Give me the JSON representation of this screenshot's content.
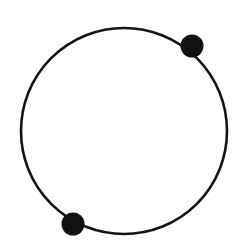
{
  "figure": {
    "type": "geometric-diagram",
    "canvas": {
      "width": 249,
      "height": 248,
      "background_color": "#ffffff"
    },
    "circle": {
      "name": "circle-outline",
      "center_x": 124,
      "center_y": 131,
      "radius": 103,
      "stroke_color": "#141414",
      "stroke_width": 2.6,
      "fill": "none",
      "style": "hand-drawn"
    },
    "points": [
      {
        "id": "point-upper-right",
        "label": "",
        "center_x": 192,
        "center_y": 46,
        "radius": 11.5,
        "fill_color": "#111111",
        "angle_degrees": 34,
        "position_description": "upper-right on circumference"
      },
      {
        "id": "point-lower-left",
        "label": "",
        "center_x": 73,
        "center_y": 224,
        "radius": 11.5,
        "fill_color": "#111111",
        "angle_degrees": 214,
        "position_description": "lower-left on circumference"
      }
    ]
  }
}
